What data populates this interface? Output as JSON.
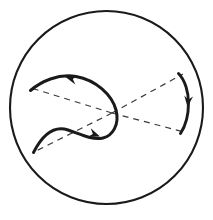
{
  "figure": {
    "kind": "geometric-diagram",
    "background_color": "#ffffff",
    "ink_color": "#1a1a1a",
    "dash_color": "#3a3a3a",
    "canvas": {
      "width": 213,
      "height": 220
    },
    "boundary": {
      "name": "enclosing-circle",
      "cx": 106.5,
      "cy": 107.5,
      "r": 96.5,
      "stroke_width": 2.1,
      "stroke": "#1a1a1a"
    },
    "saddle_point": {
      "x": 112.0,
      "y": 113.0
    },
    "asymptotes": {
      "stroke_width": 1.2,
      "stroke": "#3a3a3a",
      "dash_pattern": "6 5",
      "rays": [
        {
          "name": "asymptote-ray-upper-left",
          "x1": 112.0,
          "y1": 113.0,
          "x2": 31.0,
          "y2": 88.0
        },
        {
          "name": "asymptote-ray-lower-left",
          "x1": 112.0,
          "y1": 113.0,
          "x2": 34.0,
          "y2": 152.0
        },
        {
          "name": "asymptote-ray-upper-right",
          "x1": 112.0,
          "y1": 113.0,
          "x2": 183.0,
          "y2": 74.0
        },
        {
          "name": "asymptote-ray-lower-right",
          "x1": 112.0,
          "y1": 113.0,
          "x2": 184.0,
          "y2": 132.0
        }
      ]
    },
    "curves": [
      {
        "name": "left-invariant-curve",
        "stroke_width": 3.0,
        "stroke": "#1a1a1a",
        "path": "M 30.5 90.5 C 41 81.5, 58 73.5, 76 76.5 C 96 80, 112 95, 116 110 C 120 125, 112 136, 103 138 C 92 140.5, 80 134, 68 130 C 56 126, 44 132, 33.5 152.5"
      },
      {
        "name": "right-arc-curve",
        "stroke_width": 2.9,
        "stroke": "#1a1a1a",
        "path": "M 178.5 73.5 C 185 80, 188.5 92, 188.5 103 C 188.5 115, 185.5 126, 180.5 133.5"
      }
    ],
    "arrowheads": [
      {
        "name": "arrowhead-upper-left-inflow",
        "tip_x": 65.5,
        "tip_y": 77.0,
        "angle_deg": 196,
        "size": 11.5,
        "fill": "#1a1a1a"
      },
      {
        "name": "arrowhead-lower-left-outflow",
        "tip_x": 100.0,
        "tip_y": 136.5,
        "angle_deg": 20,
        "size": 11.5,
        "fill": "#1a1a1a"
      },
      {
        "name": "arrowhead-right-arc-downflow",
        "tip_x": 187.5,
        "tip_y": 107.0,
        "angle_deg": 96,
        "size": 11.0,
        "fill": "#1a1a1a"
      }
    ]
  }
}
